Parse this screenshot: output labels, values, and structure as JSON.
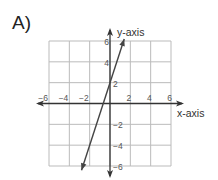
{
  "problem_label": "A)",
  "chart_data": {
    "type": "line",
    "title": "",
    "xlabel": "x-axis",
    "ylabel": "y-axis",
    "xlim": [
      -6,
      6
    ],
    "ylim": [
      -6,
      6
    ],
    "grid": true,
    "grid_step": 2,
    "x_ticks": [
      "-6",
      "-4",
      "-2",
      "2",
      "4",
      "6"
    ],
    "y_ticks": [
      "6",
      "4",
      "2",
      "-2",
      "-4",
      "-6"
    ],
    "series": [
      {
        "name": "line",
        "equation": "y = 3x + 2",
        "slope": 3,
        "y_intercept": 2,
        "arrows_both_ends": true,
        "x": [
          -2.8,
          1.4
        ],
        "y": [
          -6.4,
          6.2
        ]
      }
    ]
  },
  "colors": {
    "grid": "#bbbbbb",
    "axis": "#333333",
    "line": "#444444",
    "text": "#555555"
  }
}
